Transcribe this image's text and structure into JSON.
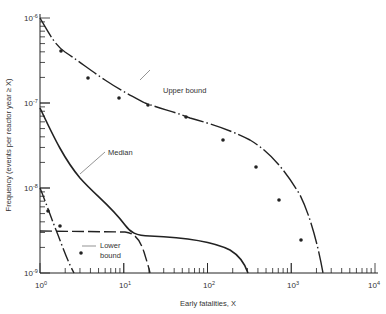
{
  "chart_data": {
    "type": "line",
    "title": "",
    "xlabel": "Early fatalities, X",
    "ylabel": "Frequency (events per reactor year ≥ X)",
    "xscale": "log",
    "yscale": "log",
    "xlim": [
      1,
      10000
    ],
    "ylim": [
      1e-09,
      1e-06
    ],
    "x_tick_labels": [
      "10^0",
      "10^1",
      "10^2",
      "10^3",
      "10^4"
    ],
    "y_tick_labels": [
      "10^-6",
      "10^-7",
      "10^-8",
      "10^-9"
    ],
    "grid": false,
    "series": [
      {
        "name": "Upper bound",
        "style": "dash-dot with dots",
        "x": [
          1,
          2,
          5,
          10,
          50,
          200,
          500,
          1000,
          2000
        ],
        "y": [
          1e-06,
          4e-07,
          2e-07,
          1.2e-07,
          5.5e-08,
          2e-08,
          7e-09,
          3e-09,
          1e-09
        ]
      },
      {
        "name": "Median",
        "style": "solid",
        "x": [
          1,
          2,
          5,
          10,
          20,
          50,
          100,
          250
        ],
        "y": [
          1.2e-07,
          4e-08,
          1.2e-08,
          5.5e-09,
          3e-09,
          2.6e-09,
          2e-09,
          1e-09
        ]
      },
      {
        "name": "Lower bound",
        "style": "dash-dot with dots",
        "x": [
          1,
          1.2,
          1.8,
          3,
          4.5
        ],
        "y": [
          1.8e-08,
          1.2e-08,
          5e-09,
          1.9e-09,
          1e-09
        ]
      },
      {
        "name": "(unlabeled dashed)",
        "style": "long dash",
        "x": [
          1,
          10,
          15,
          20
        ],
        "y": [
          3.2e-09,
          3e-09,
          2.2e-09,
          1e-09
        ]
      }
    ],
    "annotations": [
      "Upper bound",
      "Median",
      "Lower bound"
    ]
  },
  "labels": {
    "xlabel": "Early fatalities, X",
    "ylabel": "Frequency (events per reactor year ≥ X)",
    "upper": "Upper bound",
    "median": "Median",
    "lower1": "Lower",
    "lower2": "bound"
  },
  "ticks": {
    "x": [
      {
        "base": "10",
        "exp": "0"
      },
      {
        "base": "10",
        "exp": "1"
      },
      {
        "base": "10",
        "exp": "2"
      },
      {
        "base": "10",
        "exp": "3"
      },
      {
        "base": "10",
        "exp": "4"
      }
    ],
    "y": [
      {
        "base": "10",
        "exp": "-6"
      },
      {
        "base": "10",
        "exp": "-7"
      },
      {
        "base": "10",
        "exp": "-8"
      },
      {
        "base": "10",
        "exp": "-9"
      }
    ]
  }
}
